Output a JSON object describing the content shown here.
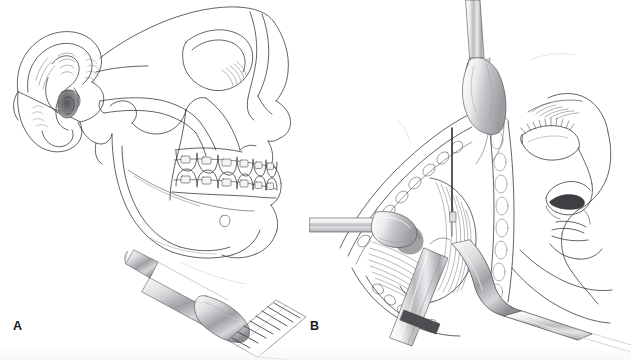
{
  "figure": {
    "kind": "medical-line-illustration",
    "background_color": "#ffffff",
    "ink_color": "#2b2b2b",
    "width": 631,
    "height": 360,
    "panels": [
      {
        "id": "A",
        "label": "A",
        "label_x": 13,
        "label_y": 320,
        "title": "Lateral skull profile with orthodontic appliances and osteotome placement",
        "structures": [
          "auricle",
          "external-auditory-meatus",
          "mastoid-process",
          "zygomatic-arch",
          "orbit",
          "nasal-bone",
          "maxilla",
          "maxillary-dentition",
          "mandibular-dentition",
          "orthodontic-brackets",
          "archwire",
          "mandibular-body",
          "mandibular-ramus",
          "mental-foramen",
          "osteotome"
        ]
      },
      {
        "id": "B",
        "label": "B",
        "label_x": 310,
        "label_y": 320,
        "title": "Intraoperative surgical exposure of the mandibular ramus with retractors",
        "structures": [
          "facial-profile",
          "eyebrow",
          "closed-eyelid",
          "eyelashes",
          "nose",
          "nostril",
          "upper-lip",
          "lower-lip",
          "surgical-incision",
          "soft-tissue-flap",
          "bone-margin",
          "muscle-fibers",
          "vertical-retractor",
          "horizontal-retractor",
          "channel-retractor",
          "osteotome",
          "probe"
        ]
      }
    ]
  },
  "legend": {
    "panel_a_label": "A",
    "panel_b_label": "B"
  }
}
